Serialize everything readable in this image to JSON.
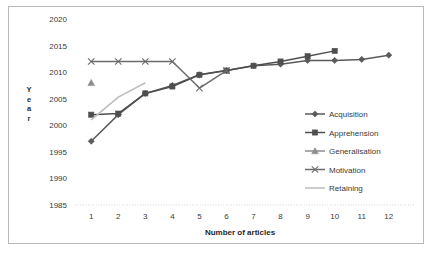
{
  "chart_data": {
    "type": "line",
    "title": "",
    "xlabel": "Number of articles",
    "ylabel": "Year",
    "xlim": [
      0.4,
      12.6
    ],
    "ylim": [
      1985,
      2020
    ],
    "yticks": [
      1985,
      1990,
      1995,
      2000,
      2005,
      2010,
      2015,
      2020
    ],
    "xticks": [
      1,
      2,
      3,
      4,
      5,
      6,
      7,
      8,
      9,
      10,
      11,
      12
    ],
    "x": [
      1,
      2,
      3,
      4,
      5,
      6,
      7,
      8,
      9,
      10,
      11,
      12
    ],
    "grid": false,
    "legend_position": "right-inside",
    "series": [
      {
        "name": "Acquisition",
        "marker": "diamond",
        "color": "#5a5a5a",
        "x": [
          1,
          2,
          3,
          4,
          5,
          6,
          7,
          8,
          9,
          10,
          11,
          12
        ],
        "values": [
          1997,
          2002,
          2006,
          2007.5,
          2009.5,
          2010.3,
          2011.2,
          2011.5,
          2012.2,
          2012.2,
          2012.4,
          2013.2
        ]
      },
      {
        "name": "Apprehension",
        "marker": "square",
        "color": "#4f4f4f",
        "x": [
          1,
          2,
          3,
          4,
          5,
          6,
          7,
          8,
          9,
          10
        ],
        "values": [
          2002,
          2002.2,
          2006,
          2007.3,
          2009.5,
          2010.3,
          2011.2,
          2012.0,
          2013.0,
          2014.0
        ]
      },
      {
        "name": "Generalisation",
        "marker": "triangle",
        "color": "#8d8d8d",
        "x": [
          1
        ],
        "values": [
          2008
        ]
      },
      {
        "name": "Motivation",
        "marker": "x",
        "color": "#6b6b6b",
        "x": [
          1,
          2,
          3,
          4,
          5,
          6
        ],
        "values": [
          2012,
          2012,
          2012,
          2012,
          2007,
          2010.3
        ]
      },
      {
        "name": "Retaining",
        "marker": "line",
        "color": "#bdbdbd",
        "x": [
          1,
          2,
          3
        ],
        "values": [
          2001,
          2005.3,
          2008
        ]
      }
    ]
  },
  "axis": {
    "y_label_letters": [
      "Y",
      "e",
      "a",
      "r"
    ],
    "y_tick_labels": [
      "2020",
      "2015",
      "2010",
      "2005",
      "2000",
      "1995",
      "1990",
      "1985"
    ],
    "x_tick_labels": [
      "1",
      "2",
      "3",
      "4",
      "5",
      "6",
      "7",
      "8",
      "9",
      "10",
      "11",
      "12"
    ],
    "x_axis_title": "Number of articles"
  },
  "legend": {
    "items": [
      {
        "label": "Acquisition",
        "marker": "diamond",
        "color": "#5a5a5a"
      },
      {
        "label": "Apprehension",
        "marker": "square",
        "color": "#4f4f4f"
      },
      {
        "label": "Generalisation",
        "marker": "triangle",
        "color": "#8d8d8d"
      },
      {
        "label": "Motivation",
        "marker": "x",
        "color": "#6b6b6b"
      },
      {
        "label": "Retaining",
        "marker": "line",
        "color": "#bdbdbd"
      }
    ]
  },
  "colors": {
    "border": "#b9b9b9",
    "baseline": "#c8c8c8",
    "text": "#3a3a3a",
    "background": "#ffffff"
  }
}
